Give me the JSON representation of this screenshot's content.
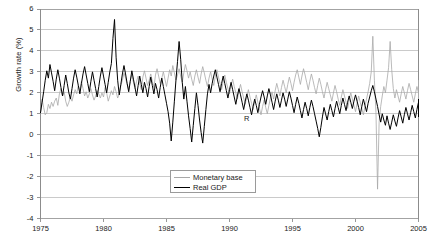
{
  "chart_data": {
    "type": "line",
    "title": "",
    "xlabel": "",
    "ylabel": "Growth rate (%)",
    "xlim": [
      1975,
      2005
    ],
    "ylim": [
      -4,
      6
    ],
    "ytick_labels": [
      "6",
      "5",
      "4",
      "3",
      "2",
      "1",
      "0",
      "-1",
      "-2",
      "-3",
      "-4"
    ],
    "ytick_values": [
      6,
      5,
      4,
      3,
      2,
      1,
      0,
      -1,
      -2,
      -3,
      -4
    ],
    "xtick_labels": [
      "1975",
      "1980",
      "1985",
      "1990",
      "1995",
      "2000",
      "2005"
    ],
    "xtick_values": [
      1975,
      1980,
      1985,
      1990,
      1995,
      2000,
      2005
    ],
    "grid": "horizontal",
    "legend_position": "bottom-center",
    "annotations": [
      {
        "text": "R",
        "x": 1991.0,
        "y": 0.75
      }
    ],
    "series": [
      {
        "name": "Monetary base",
        "color": "#a8a8a8",
        "x_start": 1975.0,
        "x_step": 0.125,
        "values": [
          1.05,
          1.7,
          1.3,
          0.95,
          1.05,
          1.45,
          1.25,
          1.55,
          1.35,
          1.6,
          1.75,
          1.4,
          1.95,
          2.2,
          1.85,
          2.05,
          1.6,
          1.35,
          1.55,
          1.8,
          1.6,
          1.9,
          2.15,
          1.95,
          2.35,
          2.1,
          2.55,
          2.2,
          1.85,
          2.05,
          1.75,
          1.95,
          2.2,
          1.9,
          1.65,
          1.85,
          2.1,
          1.95,
          1.75,
          2.0,
          1.8,
          2.25,
          2.0,
          1.6,
          1.85,
          2.1,
          1.9,
          2.3,
          2.05,
          1.75,
          1.95,
          2.35,
          2.6,
          2.95,
          2.7,
          2.4,
          2.15,
          2.6,
          2.85,
          2.5,
          2.2,
          2.55,
          2.8,
          2.45,
          2.15,
          2.75,
          3.05,
          2.7,
          2.35,
          2.6,
          2.9,
          2.55,
          2.25,
          2.85,
          3.15,
          2.8,
          2.45,
          2.7,
          3.0,
          2.65,
          2.3,
          2.7,
          3.1,
          2.8,
          3.3,
          2.95,
          2.6,
          2.85,
          3.15,
          2.8,
          2.5,
          2.95,
          3.35,
          3.05,
          2.7,
          3.0,
          2.65,
          2.35,
          2.8,
          3.1,
          2.75,
          2.45,
          2.9,
          3.25,
          2.95,
          2.6,
          2.3,
          2.7,
          3.0,
          2.65,
          2.35,
          2.8,
          3.1,
          2.75,
          2.45,
          2.15,
          2.55,
          2.85,
          2.5,
          2.2,
          1.95,
          2.35,
          2.65,
          2.3,
          2.0,
          1.7,
          2.1,
          2.4,
          2.05,
          1.75,
          1.45,
          1.85,
          2.15,
          1.8,
          1.5,
          1.2,
          1.6,
          1.9,
          1.55,
          1.25,
          0.95,
          1.35,
          1.65,
          1.3,
          1.0,
          1.4,
          1.75,
          2.05,
          1.7,
          2.1,
          2.45,
          2.15,
          1.85,
          2.25,
          2.6,
          2.3,
          2.0,
          2.4,
          2.75,
          2.45,
          2.1,
          2.5,
          2.85,
          3.1,
          2.75,
          2.4,
          2.8,
          3.15,
          2.85,
          2.5,
          2.15,
          2.55,
          2.9,
          2.6,
          2.25,
          1.95,
          2.35,
          2.7,
          2.4,
          2.05,
          1.75,
          2.15,
          2.5,
          2.2,
          1.9,
          1.6,
          2.0,
          2.35,
          2.05,
          1.7,
          1.4,
          1.8,
          2.15,
          1.85,
          1.55,
          1.25,
          1.65,
          2.0,
          1.7,
          1.4,
          1.1,
          1.5,
          1.85,
          1.55,
          1.25,
          0.95,
          1.35,
          1.7,
          2.05,
          2.45,
          3.0,
          4.7,
          2.6,
          1.05,
          -2.6,
          0.6,
          1.35,
          1.85,
          2.3,
          2.0,
          2.6,
          3.2,
          4.45,
          3.1,
          2.2,
          1.75,
          2.15,
          1.85,
          1.55,
          1.95,
          2.3,
          2.0,
          1.7,
          2.1,
          2.45,
          2.15,
          1.85,
          1.55,
          1.95,
          2.3,
          2.0,
          1.7,
          2.05,
          2.35,
          2.6,
          2.3,
          1.95,
          1.65,
          1.35,
          1.7,
          2.0,
          1.7,
          1.4,
          1.75,
          2.05,
          1.75
        ]
      },
      {
        "name": "Real GDP",
        "color": "#000000",
        "x_start": 1975.0,
        "x_step": 0.125,
        "values": [
          1.05,
          1.55,
          2.05,
          2.6,
          3.05,
          2.7,
          3.35,
          2.95,
          2.55,
          2.1,
          2.65,
          3.1,
          2.7,
          2.25,
          1.85,
          2.35,
          2.85,
          2.45,
          2.0,
          1.7,
          2.2,
          2.7,
          3.1,
          2.75,
          2.35,
          1.95,
          2.45,
          2.9,
          3.25,
          2.85,
          2.45,
          2.05,
          2.55,
          3.0,
          2.6,
          2.2,
          1.8,
          2.3,
          2.8,
          3.2,
          2.8,
          2.4,
          2.0,
          2.5,
          3.0,
          3.4,
          4.6,
          5.5,
          3.7,
          2.6,
          1.9,
          2.4,
          2.9,
          3.3,
          2.9,
          2.45,
          2.05,
          2.55,
          3.05,
          2.65,
          2.25,
          1.85,
          2.35,
          2.8,
          2.4,
          2.0,
          2.5,
          2.2,
          1.8,
          2.3,
          2.75,
          2.35,
          1.95,
          2.45,
          2.15,
          1.75,
          2.25,
          2.7,
          2.3,
          1.9,
          1.5,
          1.1,
          0.55,
          -0.3,
          0.6,
          1.6,
          2.6,
          3.5,
          4.45,
          3.6,
          2.5,
          1.7,
          2.3,
          1.6,
          0.9,
          0.3,
          -0.35,
          0.45,
          1.25,
          2.0,
          1.4,
          0.7,
          0.1,
          -0.4,
          0.4,
          1.2,
          1.95,
          2.4,
          2.0,
          2.45,
          2.8,
          3.1,
          2.75,
          2.4,
          2.05,
          2.45,
          2.8,
          2.45,
          2.1,
          1.75,
          2.15,
          2.5,
          2.15,
          1.8,
          1.45,
          1.85,
          2.2,
          1.9,
          1.55,
          1.2,
          1.6,
          1.95,
          1.65,
          1.3,
          0.95,
          1.35,
          1.7,
          1.4,
          1.05,
          1.45,
          1.8,
          2.1,
          1.8,
          1.45,
          1.85,
          2.2,
          1.9,
          1.55,
          1.2,
          1.6,
          1.95,
          1.65,
          1.3,
          1.65,
          2.0,
          1.7,
          1.35,
          1.7,
          2.05,
          1.75,
          1.4,
          1.05,
          1.45,
          1.8,
          1.5,
          1.15,
          0.8,
          1.2,
          1.55,
          1.25,
          0.9,
          1.3,
          1.65,
          1.35,
          1.0,
          0.65,
          0.3,
          -0.1,
          0.35,
          0.85,
          1.3,
          1.0,
          0.7,
          1.1,
          1.45,
          1.15,
          0.85,
          1.25,
          1.6,
          1.3,
          1.0,
          1.4,
          1.75,
          1.45,
          1.15,
          1.55,
          1.85,
          1.55,
          1.25,
          1.6,
          1.9,
          1.6,
          1.3,
          0.95,
          1.35,
          1.7,
          1.4,
          1.1,
          1.5,
          1.8,
          2.1,
          2.35,
          2.05,
          1.7,
          1.35,
          0.95,
          0.6,
          1.0,
          0.7,
          0.45,
          0.9,
          0.55,
          0.25,
          0.6,
          0.95,
          0.65,
          0.4,
          0.8,
          1.15,
          0.85,
          0.55,
          0.95,
          1.3,
          1.0,
          0.7,
          1.05,
          1.4,
          1.1,
          0.8,
          1.2,
          1.55,
          1.25,
          0.95,
          1.35,
          1.7,
          1.4,
          1.1,
          1.45,
          1.15,
          0.85,
          1.25,
          1.6,
          1.3,
          1.0,
          1.4,
          1.55
        ]
      }
    ]
  },
  "axes": {
    "ylabel": "Growth rate (%)"
  },
  "legend": {
    "items": [
      {
        "label": "Monetary base",
        "color": "#a8a8a8"
      },
      {
        "label": "Real GDP",
        "color": "#000000"
      }
    ]
  }
}
